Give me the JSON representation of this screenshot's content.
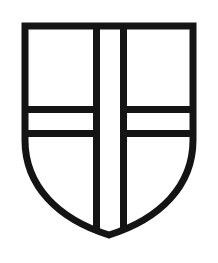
{
  "image": {
    "kind": "heraldic-shield-drawing",
    "title": "Coat of arms shield with cross",
    "width": 218,
    "height": 263,
    "background_color": "#ffffff"
  },
  "shield": {
    "name": "escutcheon",
    "description": "Heraldic shield outline, straight sides curving to a point at base",
    "outline_color": "#141414",
    "field_color": "#ffffff",
    "outline_width": 7,
    "geometry": {
      "left": 22,
      "right": 196,
      "top": 23,
      "point_x": 109,
      "point_y": 238,
      "straight_side_bottom_y": 140
    },
    "path": "M 25 26 L 193 26 L 193 140 C 193 186 160 219 109 235 C 58 219 25 186 25 140 Z"
  },
  "charge": {
    "name": "cross",
    "type": "greek-cross",
    "color": "#141414",
    "stroke_width": 7,
    "vertical_bar": {
      "left_x": 93,
      "right_x": 127,
      "top_y": 23,
      "bottom_y": 236
    },
    "horizontal_bar": {
      "top_y": 106,
      "bottom_y": 137,
      "left_x": 22,
      "right_x": 196
    }
  },
  "quarters": [
    {
      "name": "quarter-top-left",
      "position": "dexter chief",
      "fill": "#ffffff"
    },
    {
      "name": "quarter-top-right",
      "position": "sinister chief",
      "fill": "#ffffff"
    },
    {
      "name": "quarter-bottom-left",
      "position": "dexter base",
      "fill": "#ffffff"
    },
    {
      "name": "quarter-bottom-right",
      "position": "sinister base",
      "fill": "#ffffff"
    }
  ]
}
